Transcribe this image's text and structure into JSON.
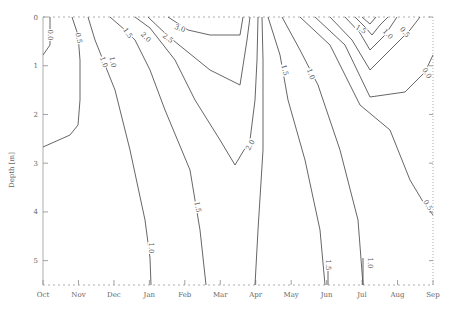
{
  "chart_data": {
    "type": "contour",
    "title": "",
    "xlabel": "",
    "ylabel": "Depth [m]",
    "x_categories": [
      "Oct",
      "Nov",
      "Dec",
      "Jan",
      "Feb",
      "Mar",
      "Apr",
      "May",
      "Jun",
      "Jul",
      "Aug",
      "Sep"
    ],
    "y_ticks": [
      "0",
      "1",
      "2",
      "3",
      "4",
      "5"
    ],
    "ylim": [
      0,
      5.5
    ],
    "y_inverted": true,
    "grid": false,
    "contour_levels": [
      "0.0",
      "0.5",
      "1.0",
      "1.5",
      "2.0",
      "2.5",
      "3.0"
    ],
    "contours": [
      {
        "level": "0.0",
        "label_pos": [
          50,
          35
        ],
        "label_rot": 90,
        "points": [
          [
            50,
            17
          ],
          [
            50,
            45
          ],
          [
            43,
            55
          ]
        ]
      },
      {
        "level": "0.5",
        "label_pos": [
          78,
          38
        ],
        "label_rot": 80,
        "points": [
          [
            72,
            17
          ],
          [
            78,
            35
          ],
          [
            80,
            60
          ],
          [
            80,
            100
          ],
          [
            78,
            125
          ],
          [
            70,
            135
          ],
          [
            43,
            147
          ]
        ]
      },
      {
        "level": "1.0",
        "label_pos": [
          103,
          60
        ],
        "label_rot": 70,
        "points": [
          [
            88,
            17
          ],
          [
            95,
            40
          ],
          [
            103,
            60
          ],
          [
            115,
            90
          ],
          [
            130,
            150
          ],
          [
            145,
            220
          ],
          [
            150,
            258
          ],
          [
            151,
            285
          ]
        ]
      },
      {
        "level": "1.5",
        "label_pos": [
          128,
          32
        ],
        "label_rot": 55,
        "points": [
          [
            110,
            17
          ],
          [
            125,
            30
          ],
          [
            135,
            40
          ],
          [
            150,
            70
          ],
          [
            165,
            110
          ],
          [
            190,
            170
          ],
          [
            200,
            230
          ],
          [
            206,
            285
          ]
        ]
      },
      {
        "level": "2.0",
        "label_pos": [
          147,
          35
        ],
        "label_rot": 45,
        "points": [
          [
            135,
            17
          ],
          [
            150,
            28
          ],
          [
            175,
            60
          ],
          [
            195,
            100
          ],
          [
            220,
            140
          ],
          [
            235,
            165
          ]
        ]
      },
      {
        "level": "2.5",
        "label_pos": [
          165,
          35
        ],
        "label_rot": 35,
        "points": [
          [
            148,
            17
          ],
          [
            168,
            36
          ],
          [
            210,
            70
          ],
          [
            240,
            85
          ],
          [
            247,
            40
          ],
          [
            250,
            17
          ]
        ]
      },
      {
        "level": "3.0",
        "label_pos": [
          180,
          27
        ],
        "label_rot": 20,
        "points": [
          [
            168,
            17
          ],
          [
            188,
            30
          ],
          [
            210,
            35
          ],
          [
            240,
            35
          ],
          [
            243,
            17
          ]
        ]
      },
      {
        "level": "2.0",
        "label_pos": [
          250,
          140
        ],
        "label_rot": -60,
        "points": [
          [
            235,
            165
          ],
          [
            250,
            140
          ],
          [
            255,
            100
          ],
          [
            257,
            60
          ],
          [
            258,
            17
          ]
        ]
      },
      {
        "level": "2.0b",
        "label_pos": [
          0,
          0
        ],
        "label_rot": 0,
        "points": [
          [
            262,
            17
          ],
          [
            263,
            60
          ],
          [
            263,
            150
          ],
          [
            258,
            230
          ],
          [
            255,
            285
          ]
        ]
      },
      {
        "level": "1.5",
        "label_pos": [
          283,
          70
        ],
        "label_rot": 75,
        "points": [
          [
            268,
            17
          ],
          [
            280,
            55
          ],
          [
            288,
            100
          ],
          [
            305,
            160
          ],
          [
            320,
            230
          ],
          [
            325,
            285
          ]
        ]
      },
      {
        "level": "1.0",
        "label_pos": [
          312,
          72
        ],
        "label_rot": 70,
        "points": [
          [
            282,
            17
          ],
          [
            300,
            50
          ],
          [
            318,
            85
          ],
          [
            340,
            150
          ],
          [
            358,
            220
          ],
          [
            363,
            285
          ]
        ]
      },
      {
        "level": "1.5",
        "label_pos": [
          328,
          262
        ],
        "label_rot": 0,
        "points": [
          [
            328,
            285
          ],
          [
            328,
            262
          ]
        ]
      },
      {
        "level": "1.0",
        "label_pos": [
          363,
          258
        ],
        "label_rot": 0,
        "points": [
          [
            363,
            285
          ],
          [
            363,
            258
          ]
        ]
      },
      {
        "level": "0.5",
        "label_pos": [
          425,
          205
        ],
        "label_rot": 60,
        "points": [
          [
            300,
            17
          ],
          [
            330,
            45
          ],
          [
            360,
            105
          ],
          [
            390,
            130
          ],
          [
            410,
            180
          ],
          [
            425,
            205
          ],
          [
            433,
            215
          ]
        ]
      },
      {
        "level": "0.0",
        "label_pos": [
          425,
          72
        ],
        "label_rot": 60,
        "points": [
          [
            315,
            17
          ],
          [
            345,
            45
          ],
          [
            370,
            97
          ],
          [
            405,
            92
          ],
          [
            425,
            72
          ],
          [
            433,
            55
          ]
        ]
      },
      {
        "level": "0.5",
        "label_pos": [
          405,
          32
        ],
        "label_rot": 50,
        "points": [
          [
            330,
            17
          ],
          [
            352,
            40
          ],
          [
            370,
            70
          ],
          [
            395,
            45
          ],
          [
            410,
            30
          ],
          [
            420,
            17
          ]
        ]
      },
      {
        "level": "1.0",
        "label_pos": [
          385,
          32
        ],
        "label_rot": 45,
        "points": [
          [
            345,
            17
          ],
          [
            360,
            33
          ],
          [
            370,
            50
          ],
          [
            385,
            35
          ],
          [
            397,
            17
          ]
        ]
      },
      {
        "level": "1.5",
        "label_pos": [
          360,
          28
        ],
        "label_rot": 30,
        "points": [
          [
            355,
            17
          ],
          [
            365,
            27
          ],
          [
            372,
            35
          ],
          [
            380,
            25
          ],
          [
            388,
            17
          ]
        ]
      },
      {
        "level": "2.0",
        "label_pos": [
          0,
          0
        ],
        "label_rot": 0,
        "points": [
          [
            362,
            17
          ],
          [
            370,
            24
          ],
          [
            376,
            17
          ]
        ]
      }
    ],
    "contour_labels_visible": [
      {
        "text": "0.0",
        "x": 50,
        "y": 35,
        "rot": 90
      },
      {
        "text": "0.5",
        "x": 79,
        "y": 38,
        "rot": 80
      },
      {
        "text": "1.0",
        "x": 104,
        "y": 62,
        "rot": 70
      },
      {
        "text": "1.5",
        "x": 128,
        "y": 33,
        "rot": 55
      },
      {
        "text": "2.0",
        "x": 146,
        "y": 37,
        "rot": 45
      },
      {
        "text": "2.5",
        "x": 168,
        "y": 38,
        "rot": 35
      },
      {
        "text": "3.0",
        "x": 180,
        "y": 28,
        "rot": 20
      },
      {
        "text": "2.0",
        "x": 250,
        "y": 145,
        "rot": -60
      },
      {
        "text": "1.5",
        "x": 285,
        "y": 70,
        "rot": 75
      },
      {
        "text": "1.0",
        "x": 311,
        "y": 74,
        "rot": 70
      },
      {
        "text": "1.0",
        "x": 151,
        "y": 248,
        "rot": 90
      },
      {
        "text": "1.5",
        "x": 198,
        "y": 207,
        "rot": 80
      },
      {
        "text": "1.5",
        "x": 328,
        "y": 265,
        "rot": 90
      },
      {
        "text": "1.0",
        "x": 370,
        "y": 263,
        "rot": 90
      },
      {
        "text": "0.5",
        "x": 428,
        "y": 205,
        "rot": 60
      },
      {
        "text": "0.0",
        "x": 427,
        "y": 73,
        "rot": 60
      },
      {
        "text": "0.5",
        "x": 405,
        "y": 32,
        "rot": 50
      },
      {
        "text": "1.0",
        "x": 388,
        "y": 34,
        "rot": 45
      },
      {
        "text": "1.5",
        "x": 361,
        "y": 29,
        "rot": 30
      },
      {
        "text": "1.0",
        "x": 113,
        "y": 62,
        "rot": 80
      }
    ]
  }
}
